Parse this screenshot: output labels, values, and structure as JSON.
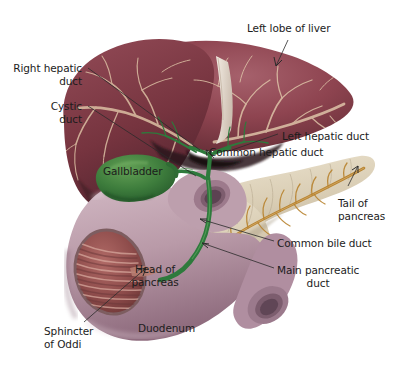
{
  "figure": {
    "background_color": "#ffffff"
  },
  "palette": {
    "liver": "#8e4450",
    "liver_dark": "#6a2f3a",
    "liver_light": "#a8606b",
    "liver_vessel": "#d8bda0",
    "falciform": "#efe6dd",
    "gallbladder": "#2f6b34",
    "gallbladder_light": "#4f8c46",
    "bile_duct": "#2e7a3c",
    "pancreas": "#ddd2bb",
    "pancreas_shadow": "#bfb49b",
    "pancreatic_duct": "#b8832f",
    "duodenum": "#b99aa8",
    "duodenum_light": "#cbb0bb",
    "mucosa": "#9c5b5b",
    "mucosa_dark": "#7d4040",
    "text": "#1c1c1c",
    "leader": "#2b2b2b"
  },
  "labels": [
    {
      "id": "left-lobe-of-liver",
      "text": "Left lobe of liver",
      "lines": [
        "Left lobe of liver"
      ],
      "align": "left",
      "x": 247,
      "y": 22
    },
    {
      "id": "right-hepatic-duct",
      "text": "Right hepatic duct",
      "lines": [
        "Right hepatic",
        "duct"
      ],
      "align": "right",
      "x": 6,
      "y": 62
    },
    {
      "id": "cystic-duct",
      "text": "Cystic duct",
      "lines": [
        "Cystic",
        "duct"
      ],
      "align": "right",
      "x": 6,
      "y": 100
    },
    {
      "id": "left-hepatic-duct",
      "text": "Left hepatic duct",
      "lines": [
        "Left hepatic duct"
      ],
      "align": "left",
      "x": 282,
      "y": 130
    },
    {
      "id": "common-hepatic-duct",
      "text": "Common hepatic duct",
      "lines": [
        "Common hepatic duct"
      ],
      "align": "left",
      "x": 209,
      "y": 146
    },
    {
      "id": "gallbladder",
      "text": "Gallbladder",
      "lines": [
        "Gallbladder"
      ],
      "align": "left",
      "x": 103,
      "y": 165
    },
    {
      "id": "tail-of-pancreas",
      "text": "Tail of pancreas",
      "lines": [
        "Tail of",
        "pancreas"
      ],
      "align": "left",
      "x": 338,
      "y": 197
    },
    {
      "id": "common-bile-duct",
      "text": "Common bile duct",
      "lines": [
        "Common bile duct"
      ],
      "align": "left",
      "x": 277,
      "y": 237
    },
    {
      "id": "head-of-pancreas",
      "text": "Head of pancreas",
      "lines": [
        "Head of",
        "pancreas"
      ],
      "align": "center",
      "x": 155,
      "y": 263
    },
    {
      "id": "main-pancreatic-duct",
      "text": "Main pancreatic duct",
      "lines": [
        "Main pancreatic",
        "duct"
      ],
      "align": "center",
      "x": 277,
      "y": 264
    },
    {
      "id": "duodenum",
      "text": "Duodenum",
      "lines": [
        "Duodenum"
      ],
      "align": "left",
      "x": 138,
      "y": 322
    },
    {
      "id": "sphincter-of-oddi",
      "text": "Sphincter of Oddi",
      "lines": [
        "Sphincter",
        "of Oddi"
      ],
      "align": "left",
      "x": 44,
      "y": 325
    }
  ],
  "structures": [
    {
      "id": "liver",
      "name": "Liver",
      "description": "Large maroon organ occupying the upper portion, with pale branching hepatic vessels and a white falciform ligament dividing the lobes."
    },
    {
      "id": "gallbladder",
      "name": "Gallbladder",
      "description": "Green pear-shaped sac beneath the liver."
    },
    {
      "id": "biliary-tree",
      "name": "Biliary tree",
      "description": "Green ducts: right and left hepatic ducts joining into the common hepatic duct, the cystic duct from the gallbladder, and the common bile duct descending into the duodenum."
    },
    {
      "id": "pancreas",
      "name": "Pancreas",
      "description": "Tan lobulated gland with head near the duodenum and tail extending to the upper right; orange-brown main pancreatic duct runs through it."
    },
    {
      "id": "duodenum",
      "name": "Duodenum",
      "description": "Mauve C-shaped tube, cut open to reveal reddish mucosal folds and the sphincter of Oddi."
    }
  ]
}
